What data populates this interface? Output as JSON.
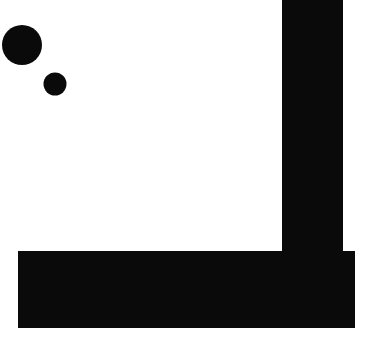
{
  "canvas": {
    "name": "shapes-canvas",
    "width": 365,
    "height": 344,
    "background_color": "#ffffff",
    "foreground_color": "#0a0a0a"
  },
  "shapes": [
    {
      "id": "large-circle",
      "type": "circle",
      "label": "large filled circle",
      "fill": "#0a0a0a",
      "cx": 22,
      "cy": 45,
      "r": 20
    },
    {
      "id": "small-circle",
      "type": "circle",
      "label": "small filled circle",
      "fill": "#0a0a0a",
      "cx": 55,
      "cy": 84,
      "r": 11.5
    },
    {
      "id": "vertical-bar",
      "type": "rectangle",
      "label": "vertical bar",
      "fill": "#0a0a0a",
      "x": 282,
      "y": -4,
      "width": 61,
      "height": 256
    },
    {
      "id": "horizontal-bar",
      "type": "rectangle",
      "label": "horizontal bar",
      "fill": "#0a0a0a",
      "x": 18,
      "y": 251,
      "width": 337,
      "height": 77
    }
  ]
}
